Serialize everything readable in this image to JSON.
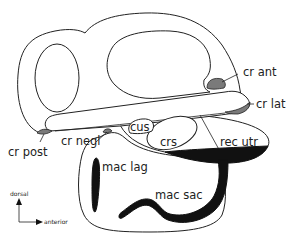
{
  "diagram": {
    "type": "anatomical-schematic",
    "labels": {
      "cr_ant": "cr ant",
      "cr_lat": "cr lat",
      "cr_post": "cr post",
      "cr_negl": "cr negl",
      "cus": "cus",
      "crs": "crs",
      "rec_utr": "rec utr",
      "mac_lag": "mac lag",
      "mac_sac": "mac sac"
    },
    "orientation": {
      "vertical_axis": "dorsal",
      "horizontal_axis": "anterior"
    },
    "colors": {
      "outline": "#222222",
      "crista_fill": "#7a7a7a",
      "macula_fill": "#111111",
      "background": "#ffffff"
    }
  }
}
